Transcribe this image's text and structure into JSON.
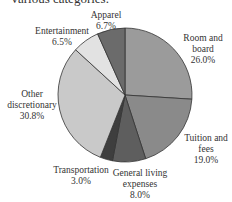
{
  "caption": "Various categories.",
  "chart_data": {
    "type": "pie",
    "title": "",
    "start_angle_deg": 0,
    "direction": "clockwise",
    "slices": [
      {
        "label": "Room and board",
        "value": 26.0,
        "display": "26.0%",
        "color": "#9b9b9b"
      },
      {
        "label": "Tuition and fees",
        "value": 19.0,
        "display": "19.0%",
        "color": "#8a8a8a"
      },
      {
        "label": "General living expenses",
        "value": 8.0,
        "display": "8.0%",
        "color": "#5e5e5e"
      },
      {
        "label": "Transportation",
        "value": 3.0,
        "display": "3.0%",
        "color": "#3e3e3e"
      },
      {
        "label": "Other discretionary",
        "value": 30.8,
        "display": "30.8%",
        "color": "#c9c9c9"
      },
      {
        "label": "Entertainment",
        "value": 6.5,
        "display": "6.5%",
        "color": "#e2e2e2"
      },
      {
        "label": "Apparel",
        "value": 6.7,
        "display": "6.7%",
        "color": "#6b6b6b"
      }
    ]
  },
  "labels": {
    "room": {
      "line1": "Room and",
      "line2": "board",
      "pct": "26.0%"
    },
    "tuition": {
      "line1": "Tuition and",
      "line2": "fees",
      "pct": "19.0%"
    },
    "general": {
      "line1": "General living",
      "line2": "expenses",
      "pct": "8.0%"
    },
    "transport": {
      "line1": "Transportation",
      "pct": "3.0%"
    },
    "other": {
      "line1": "Other",
      "line2": "discretionary",
      "pct": "30.8%"
    },
    "entertainment": {
      "line1": "Entertainment",
      "pct": "6.5%"
    },
    "apparel": {
      "line1": "Apparel",
      "pct": "6.7%"
    }
  }
}
